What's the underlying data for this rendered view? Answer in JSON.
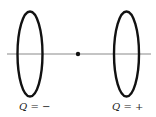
{
  "diagram": {
    "axis": {
      "x1": 7,
      "x2": 151,
      "y": 54,
      "color": "#8a8a8a"
    },
    "midpoint": {
      "x": 78,
      "y": 54,
      "r": 2.2,
      "color": "#111111"
    },
    "rings": [
      {
        "id": "left",
        "cx": 30,
        "cy": 54,
        "rx": 12.5,
        "ry": 42.5,
        "color": "#111111",
        "label": {
          "symbol": "Q",
          "eq": " = ",
          "sign": "−"
        }
      },
      {
        "id": "right",
        "cx": 126.5,
        "cy": 54,
        "rx": 12.5,
        "ry": 42.5,
        "color": "#111111",
        "label": {
          "symbol": "Q",
          "eq": " = ",
          "sign": "+"
        }
      }
    ]
  }
}
